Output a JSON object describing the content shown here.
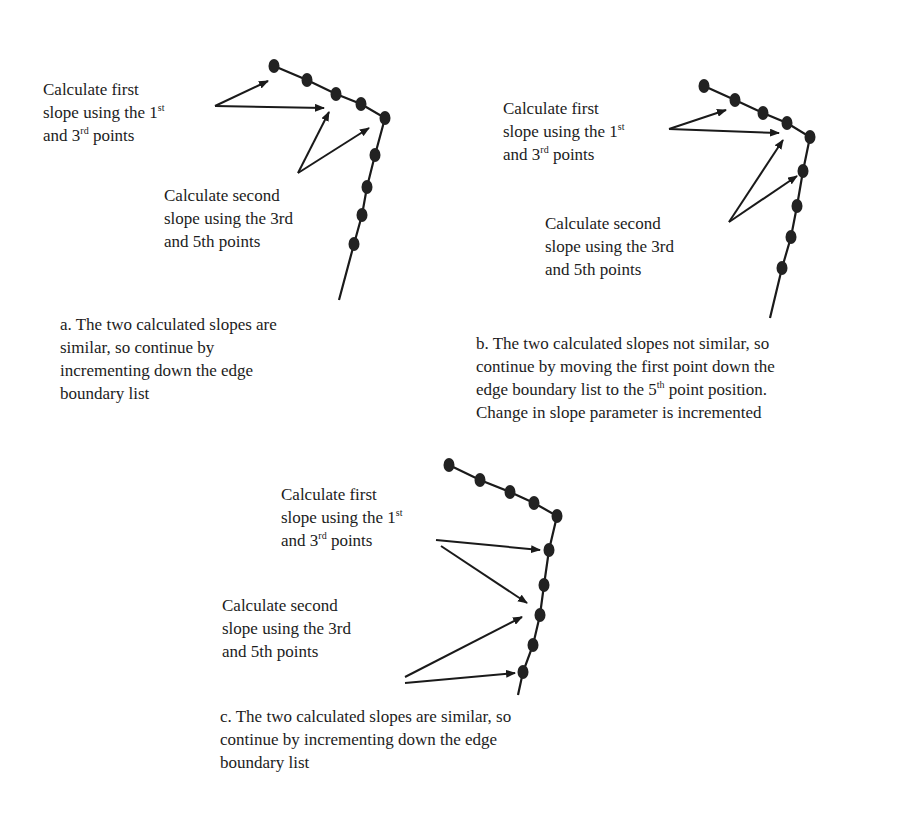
{
  "panels": [
    {
      "id": "a",
      "first_slope_label": [
        "Calculate first",
        "slope using the 1",
        "st",
        " ",
        "and 3",
        "rd",
        " points"
      ],
      "second_slope_label": [
        "Calculate second",
        "slope using the 3rd",
        "and 5th points"
      ],
      "caption": [
        "a. The two calculated slopes are",
        "similar, so continue by",
        "incrementing down the edge",
        "boundary list"
      ],
      "points": [
        [
          274,
          66
        ],
        [
          307,
          80
        ],
        [
          336,
          94
        ],
        [
          361,
          104
        ],
        [
          385,
          118
        ],
        [
          375,
          155
        ],
        [
          367,
          187
        ],
        [
          362,
          215
        ],
        [
          354,
          244
        ]
      ],
      "tail": [
        339,
        300
      ],
      "arrows": [
        {
          "from": [
            215,
            106
          ],
          "to": [
            268,
            81
          ]
        },
        {
          "from": [
            215,
            106
          ],
          "to": [
            324,
            108
          ]
        },
        {
          "from": [
            298,
            173
          ],
          "to": [
            329,
            112
          ]
        },
        {
          "from": [
            298,
            173
          ],
          "to": [
            369,
            128
          ]
        }
      ]
    },
    {
      "id": "b",
      "first_slope_label": [
        "Calculate first",
        "slope using the 1",
        "st",
        " ",
        "and 3",
        "rd",
        " points"
      ],
      "second_slope_label": [
        "Calculate second",
        "slope using the 3rd",
        "and 5th points"
      ],
      "caption": [
        "b. The two calculated slopes not similar, so",
        "continue by moving the first point down the",
        "edge boundary list to the 5",
        "th",
        " point position.",
        "Change in slope parameter is incremented"
      ],
      "points": [
        [
          704,
          86
        ],
        [
          735,
          100
        ],
        [
          763,
          113
        ],
        [
          787,
          123
        ],
        [
          810,
          137
        ],
        [
          803,
          171
        ],
        [
          797,
          206
        ],
        [
          791,
          237
        ],
        [
          782,
          268
        ]
      ],
      "tail": [
        770,
        318
      ],
      "arrows": [
        {
          "from": [
            669,
            129
          ],
          "to": [
            726,
            110
          ]
        },
        {
          "from": [
            669,
            129
          ],
          "to": [
            779,
            133
          ]
        },
        {
          "from": [
            729,
            222
          ],
          "to": [
            783,
            140
          ]
        },
        {
          "from": [
            729,
            222
          ],
          "to": [
            797,
            176
          ]
        }
      ]
    },
    {
      "id": "c",
      "first_slope_label": [
        "Calculate first",
        "slope using the 1",
        "st",
        " ",
        "and 3",
        "rd",
        " points"
      ],
      "second_slope_label": [
        "Calculate second",
        "slope using the 3rd",
        "and 5th points"
      ],
      "caption": [
        "c. The two calculated slopes are similar, so",
        "continue by incrementing down the edge",
        "boundary list"
      ],
      "points": [
        [
          449,
          465
        ],
        [
          480,
          480
        ],
        [
          510,
          492
        ],
        [
          534,
          503
        ],
        [
          557,
          516
        ],
        [
          549,
          550
        ],
        [
          544,
          585
        ],
        [
          540,
          615
        ],
        [
          533,
          645
        ],
        [
          523,
          672
        ]
      ],
      "tail": [
        518,
        695
      ],
      "arrows": [
        {
          "from": [
            436,
            540
          ],
          "to": [
            540,
            550
          ]
        },
        {
          "from": [
            441,
            546
          ],
          "to": [
            527,
            603
          ]
        },
        {
          "from": [
            405,
            677
          ],
          "to": [
            522,
            617
          ]
        },
        {
          "from": [
            405,
            683
          ],
          "to": [
            515,
            673
          ]
        }
      ]
    }
  ],
  "colors": {
    "ink": "#1a1a1a",
    "point": "#222222",
    "background": "#ffffff"
  }
}
